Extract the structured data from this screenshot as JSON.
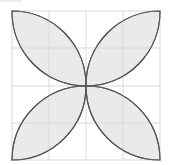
{
  "diagram": {
    "type": "four-petal-flower-on-grid",
    "grid": {
      "rows": 4,
      "cols": 4,
      "x_lines": [
        12,
        49,
        86,
        123,
        160
      ],
      "y_lines": [
        11,
        48,
        86,
        123,
        160
      ],
      "color": "#d9d9d9"
    },
    "petals": [
      {
        "name": "top-left",
        "from": [
          12,
          11
        ],
        "to": [
          86,
          86
        ]
      },
      {
        "name": "top-right",
        "from": [
          160,
          11
        ],
        "to": [
          86,
          86
        ]
      },
      {
        "name": "bottom-left",
        "from": [
          12,
          160
        ],
        "to": [
          86,
          86
        ]
      },
      {
        "name": "bottom-right",
        "from": [
          160,
          160
        ],
        "to": [
          86,
          86
        ]
      }
    ],
    "petal_fill": "#e6e6e6",
    "petal_stroke": "#555555",
    "center": [
      86,
      86
    ]
  }
}
